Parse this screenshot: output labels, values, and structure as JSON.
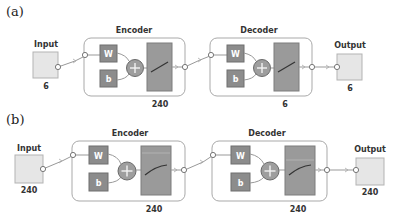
{
  "panels": [
    {
      "label": "(a)",
      "input": {
        "title": "Input",
        "size": "6"
      },
      "encoder": {
        "title": "Encoder",
        "weight": "W",
        "bias": "b",
        "size": "240"
      },
      "decoder": {
        "title": "Decoder",
        "weight": "W",
        "bias": "b",
        "size": "6"
      },
      "output": {
        "title": "Output",
        "size": "6"
      }
    },
    {
      "label": "(b)",
      "input": {
        "title": "Input",
        "size": "240"
      },
      "encoder": {
        "title": "Encoder",
        "weight": "W",
        "bias": "b",
        "size": "240"
      },
      "decoder": {
        "title": "Decoder",
        "weight": "W",
        "bias": "b",
        "size": "240"
      },
      "output": {
        "title": "Output",
        "size": "240"
      }
    }
  ],
  "icons": {
    "sum": "plus-circle",
    "transfer": "linear-transfer-function"
  }
}
